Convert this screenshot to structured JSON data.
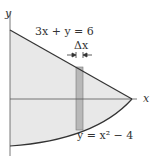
{
  "diagram": {
    "axes": {
      "x_label": "x",
      "y_label": "y"
    },
    "curves": [
      {
        "name": "line",
        "equation": "3x + y = 6"
      },
      {
        "name": "parabola",
        "equation": "y = x² − 4"
      }
    ],
    "strip": {
      "label": "Δx"
    },
    "labels": {
      "line_eq": "3x + y = 6",
      "parabola_eq": "y = x² − 4",
      "delta_x": "Δx",
      "x_axis": "x",
      "y_axis": "y"
    },
    "colors": {
      "region_fill": "#e6e6e6",
      "strip_fill": "#b4b4b4",
      "stroke": "#444444"
    }
  }
}
